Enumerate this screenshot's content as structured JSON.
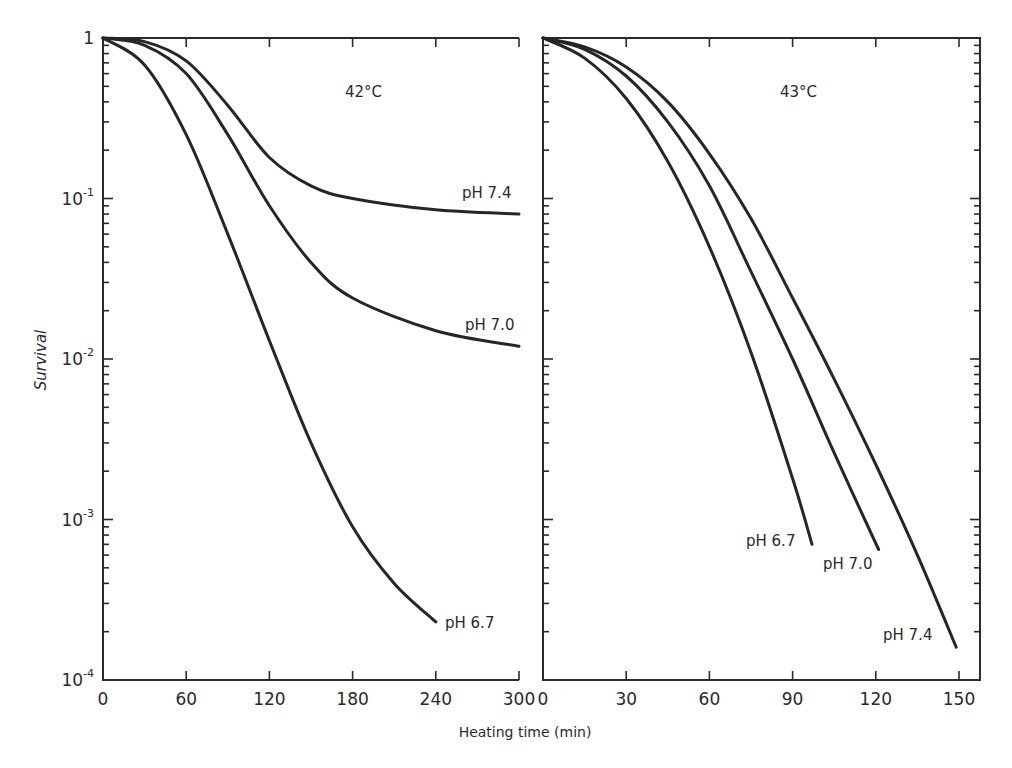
{
  "figure": {
    "ylabel": "Survival",
    "xlabel": "Heating time (min)"
  },
  "panels": [
    {
      "id": "left",
      "temperature_label": "42°C",
      "xticks": [
        "0",
        "60",
        "120",
        "180",
        "240",
        "300"
      ],
      "yticks": [
        {
          "base": "1",
          "exp": ""
        },
        {
          "base": "10",
          "exp": "-1"
        },
        {
          "base": "10",
          "exp": "-2"
        },
        {
          "base": "10",
          "exp": "-3"
        },
        {
          "base": "10",
          "exp": "-4"
        }
      ],
      "curve_labels": [
        "pH 7.4",
        "pH 7.0",
        "pH 6.7"
      ]
    },
    {
      "id": "right",
      "temperature_label": "43°C",
      "xticks": [
        "0",
        "30",
        "60",
        "90",
        "120",
        "150"
      ],
      "curve_labels": [
        "pH 6.7",
        "pH 7.0",
        "pH 7.4"
      ]
    }
  ],
  "chart_data": [
    {
      "type": "line",
      "title": "42°C",
      "xlabel": "Heating time (min)",
      "ylabel": "Survival",
      "yscale": "log",
      "xlim": [
        0,
        300
      ],
      "ylim": [
        0.0001,
        1
      ],
      "x_ticks": [
        0,
        60,
        120,
        180,
        240,
        300
      ],
      "y_ticks": [
        1,
        0.1,
        0.01,
        0.001,
        0.0001
      ],
      "grid": false,
      "legend": "inline labels at curve ends",
      "series": [
        {
          "name": "pH 7.4",
          "x": [
            0,
            30,
            60,
            90,
            120,
            150,
            180,
            240,
            300
          ],
          "y": [
            1.0,
            0.95,
            0.72,
            0.38,
            0.18,
            0.12,
            0.1,
            0.085,
            0.08
          ]
        },
        {
          "name": "pH 7.0",
          "x": [
            0,
            30,
            60,
            90,
            120,
            150,
            180,
            240,
            300
          ],
          "y": [
            1.0,
            0.9,
            0.6,
            0.25,
            0.09,
            0.04,
            0.024,
            0.015,
            0.012
          ]
        },
        {
          "name": "pH 6.7",
          "x": [
            0,
            30,
            60,
            90,
            120,
            150,
            180,
            210,
            240
          ],
          "y": [
            1.0,
            0.68,
            0.25,
            0.06,
            0.013,
            0.003,
            0.0009,
            0.0004,
            0.00023
          ]
        }
      ]
    },
    {
      "type": "line",
      "title": "43°C",
      "xlabel": "Heating time (min)",
      "ylabel": "Survival",
      "yscale": "log",
      "xlim": [
        0,
        150
      ],
      "ylim": [
        0.0001,
        1
      ],
      "x_ticks": [
        0,
        30,
        60,
        90,
        120,
        150
      ],
      "y_ticks": [
        1,
        0.1,
        0.01,
        0.001,
        0.0001
      ],
      "grid": false,
      "legend": "inline labels at curve ends",
      "series": [
        {
          "name": "pH 6.7",
          "x": [
            0,
            15,
            30,
            45,
            60,
            75,
            90,
            97
          ],
          "y": [
            1.0,
            0.75,
            0.42,
            0.17,
            0.05,
            0.011,
            0.0018,
            0.0007
          ]
        },
        {
          "name": "pH 7.0",
          "x": [
            0,
            15,
            30,
            45,
            60,
            75,
            90,
            105,
            121
          ],
          "y": [
            1.0,
            0.85,
            0.58,
            0.3,
            0.12,
            0.035,
            0.01,
            0.0026,
            0.00065
          ]
        },
        {
          "name": "pH 7.4",
          "x": [
            0,
            15,
            30,
            45,
            60,
            75,
            90,
            105,
            120,
            135,
            149
          ],
          "y": [
            1.0,
            0.88,
            0.66,
            0.4,
            0.19,
            0.075,
            0.024,
            0.0075,
            0.0022,
            0.0006,
            0.00016
          ]
        }
      ]
    }
  ]
}
